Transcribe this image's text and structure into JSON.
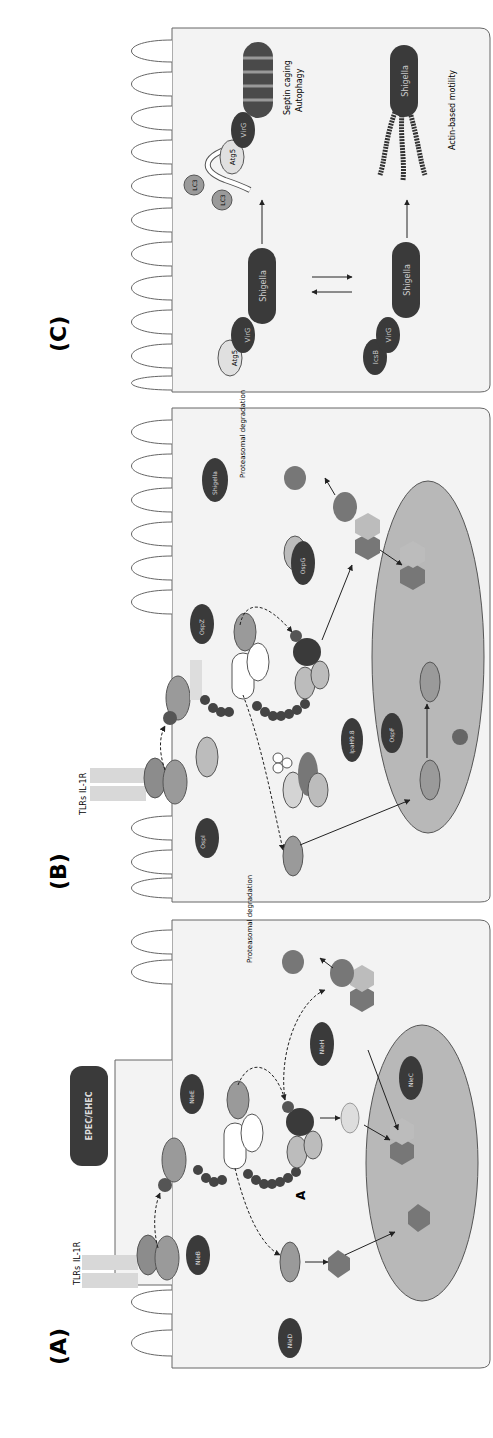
{
  "figure": {
    "orientation": "rotated 90deg counter-clockwise",
    "panels": [
      {
        "id": "A",
        "label": "(A)",
        "pathogen": "EPEC/EHEC",
        "receptors": [
          "TLRs",
          "IL-1R"
        ],
        "proteins": [
          "MyD88",
          "IRAK",
          "IRAK",
          "P",
          "TRAF6",
          "Ub",
          "Ub",
          "Ub",
          "Ub",
          "TAB2/3",
          "TAB1",
          "TAK",
          "Ub",
          "Ub",
          "Ub",
          "Ub",
          "Ub",
          "Ub",
          "NEMO",
          "IKKα",
          "IKKβ",
          "P",
          "IκBα",
          "p50",
          "p65",
          "P",
          "IκBα",
          "RPS3",
          "p50",
          "p65",
          "JNK,p38",
          "AP-1",
          "AP-1"
        ],
        "effectors": [
          "NleB",
          "NleE",
          "NleH",
          "NleC",
          "NleD"
        ],
        "marker": "A",
        "text": {
          "degradation": "Proteasomal degradation"
        }
      },
      {
        "id": "B",
        "label": "(B)",
        "receptors": [
          "TLRs",
          "IL-1R"
        ],
        "proteins": [
          "MyD88",
          "IRAK",
          "IRAK",
          "P",
          "TRAF6",
          "UBC13",
          "TAB2/3",
          "TAB1",
          "TAK",
          "NEMO",
          "IKKα",
          "IKKβ",
          "P",
          "PGN",
          "NOD",
          "RICK",
          "NEMO",
          "MAPK",
          "MAPK",
          "MAPK",
          "P",
          "H3",
          "P",
          "E2",
          "IκBα",
          "p50",
          "p65",
          "P",
          "p50",
          "p65",
          "IκBα"
        ],
        "effectors": [
          "OspI",
          "OspZ",
          "IpaH9.8",
          "OspF",
          "OspG",
          "Shigella"
        ],
        "text": {
          "degradation": "Proteasomal degradation"
        }
      },
      {
        "id": "C",
        "label": "(C)",
        "top_row": {
          "left": [
            "Atg5",
            "VirG",
            "Shigella"
          ],
          "right": [
            "LC3",
            "LC3",
            "Atg5",
            "VirG",
            "Shigella"
          ],
          "caption_lines": [
            "Septin caging",
            "Autophagy"
          ]
        },
        "bottom_row": {
          "left": [
            "IcsB",
            "VirG",
            "Shigella"
          ],
          "right": [
            "Shigella"
          ],
          "caption": "Actin-based motility"
        }
      }
    ]
  },
  "colors": {
    "cell_fill": "#f3f3f3",
    "nucleus_fill": "#b8b8b8",
    "dark_effector": "#3a3a3a",
    "mid_protein": "#8c8c8c",
    "light_protein": "#d4d4d4",
    "outline": "#555555"
  }
}
